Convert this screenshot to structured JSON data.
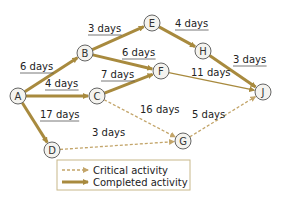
{
  "diagram": {
    "type": "activity-network",
    "colors": {
      "completed": "#a88a3e",
      "critical": "#c3a56a",
      "node_fill": "#f4f3ef",
      "node_stroke": "#555555",
      "legend_border": "#c8b88a"
    },
    "nodes": [
      {
        "id": "A",
        "label": "A",
        "x": 18,
        "y": 96
      },
      {
        "id": "B",
        "label": "B",
        "x": 85,
        "y": 53
      },
      {
        "id": "C",
        "label": "C",
        "x": 97,
        "y": 96
      },
      {
        "id": "D",
        "label": "D",
        "x": 52,
        "y": 150
      },
      {
        "id": "E",
        "label": "E",
        "x": 152,
        "y": 23
      },
      {
        "id": "F",
        "label": "F",
        "x": 161,
        "y": 71
      },
      {
        "id": "G",
        "label": "G",
        "x": 183,
        "y": 141
      },
      {
        "id": "H",
        "label": "H",
        "x": 203,
        "y": 51
      },
      {
        "id": "J",
        "label": "J",
        "x": 263,
        "y": 92
      }
    ],
    "edges": [
      {
        "from": "A",
        "to": "B",
        "label": "6 days",
        "style": "completed",
        "lx": 20,
        "ly": 70,
        "underline": true
      },
      {
        "from": "A",
        "to": "C",
        "label": "4 days",
        "style": "completed",
        "lx": 45,
        "ly": 87,
        "underline": true
      },
      {
        "from": "A",
        "to": "D",
        "label": "17 days",
        "style": "completed",
        "lx": 40,
        "ly": 118,
        "underline": true
      },
      {
        "from": "B",
        "to": "E",
        "label": "3 days",
        "style": "completed",
        "lx": 88,
        "ly": 32,
        "underline": true
      },
      {
        "from": "B",
        "to": "F",
        "label": "6 days",
        "style": "completed",
        "lx": 122,
        "ly": 56,
        "underline": true
      },
      {
        "from": "C",
        "to": "F",
        "label": "7 days",
        "style": "completed",
        "lx": 101,
        "ly": 78,
        "underline": true
      },
      {
        "from": "E",
        "to": "H",
        "label": "4 days",
        "style": "completed",
        "lx": 175,
        "ly": 27,
        "underline": true
      },
      {
        "from": "H",
        "to": "J",
        "label": "3 days",
        "style": "completed",
        "lx": 233,
        "ly": 63,
        "underline": true
      },
      {
        "from": "F",
        "to": "J",
        "label": "11 days",
        "style": "thin",
        "lx": 191,
        "ly": 76,
        "underline": false
      },
      {
        "from": "C",
        "to": "G",
        "label": "16 days",
        "style": "critical",
        "lx": 140,
        "ly": 113,
        "underline": false
      },
      {
        "from": "D",
        "to": "G",
        "label": "3 days",
        "style": "critical",
        "lx": 92,
        "ly": 136,
        "underline": false
      },
      {
        "from": "G",
        "to": "J",
        "label": "5 days",
        "style": "critical",
        "lx": 192,
        "ly": 118,
        "underline": false
      }
    ],
    "legend": {
      "items": [
        {
          "style": "critical",
          "label": "Critical activity"
        },
        {
          "style": "completed",
          "label": "Completed activity"
        }
      ]
    }
  }
}
